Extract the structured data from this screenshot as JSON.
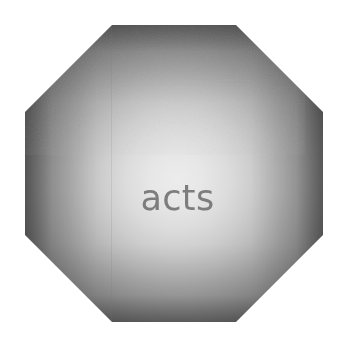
{
  "canvas": {
    "width": 346,
    "height": 347,
    "background_color": "#ffffff"
  },
  "plate": {
    "shape": "octagon",
    "label": "acts",
    "label_color": "#7d7d7d",
    "center_color": "#ececec",
    "edge_color": "#6d6d6d",
    "bounds": {
      "left": 25,
      "top": 25,
      "width": 298,
      "height": 297
    },
    "corner_cut_px": 87
  }
}
